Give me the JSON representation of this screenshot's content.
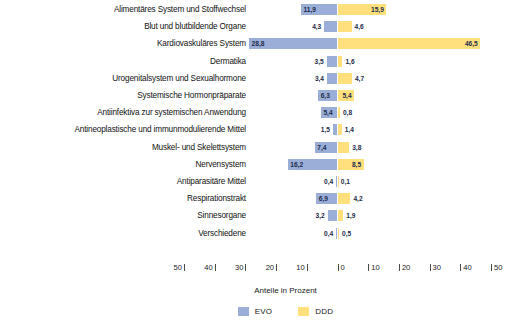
{
  "chart_data": {
    "type": "bar",
    "orientation": "horizontal-diverging",
    "title": "",
    "xlabel": "Anteile in Prozent",
    "ylabel": "",
    "xlim": [
      -50,
      50
    ],
    "xticks": [
      50,
      40,
      30,
      20,
      10,
      0,
      10,
      20,
      30,
      40,
      50
    ],
    "grid": false,
    "legend_position": "bottom",
    "categories": [
      "Alimentäres System und Stoffwechsel",
      "Blut und blutbildende Organe",
      "Kardiovaskuläres System",
      "Dermatika",
      "Urogenitalsystem und Sexualhormone",
      "Systemische Hormonpräparate",
      "Antiinfektiva zur systemischen Anwendung",
      "Antineoplastische und immunmodulierende Mittel",
      "Muskel- und Skelettsystem",
      "Nervensystem",
      "Antiparasitäre Mittel",
      "Respirationstrakt",
      "Sinnesorgane",
      "Verschiedene"
    ],
    "series": [
      {
        "name": "EVO",
        "side": "left",
        "color": "#9aaed8",
        "values": [
          11.9,
          4.3,
          28.8,
          3.5,
          3.4,
          6.3,
          5.4,
          1.5,
          7.4,
          16.2,
          0.4,
          6.9,
          3.2,
          0.4
        ],
        "labels": [
          "11,9",
          "4,3",
          "28,8",
          "3,5",
          "3,4",
          "6,3",
          "5,4",
          "1,5",
          "7,4",
          "16,2",
          "0,4",
          "6,9",
          "3,2",
          "0,4"
        ]
      },
      {
        "name": "DDD",
        "side": "right",
        "color": "#ffe07d",
        "values": [
          15.9,
          4.6,
          46.5,
          1.6,
          4.7,
          5.4,
          0.8,
          1.4,
          3.8,
          8.5,
          0.1,
          4.2,
          1.9,
          0.5
        ],
        "labels": [
          "15,9",
          "4,6",
          "46,5",
          "1,6",
          "4,7",
          "5,4",
          "0,8",
          "1,4",
          "3,8",
          "8,5",
          "0,1",
          "4,2",
          "1,9",
          "0,5"
        ]
      }
    ],
    "legend": [
      {
        "label": "EVO",
        "color": "#9aaed8"
      },
      {
        "label": "DDD",
        "color": "#ffe07d"
      }
    ]
  }
}
